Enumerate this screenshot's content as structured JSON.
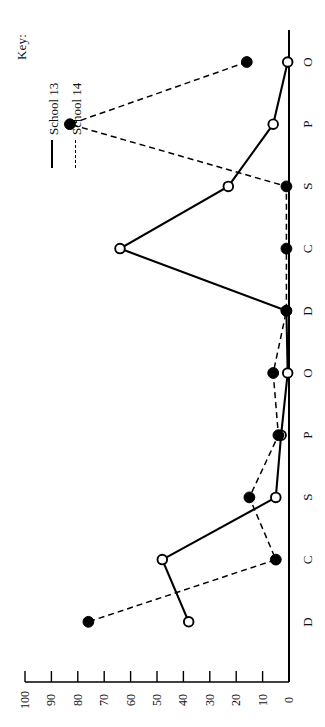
{
  "legend": {
    "title": "Key:",
    "entries": [
      {
        "label": "School 13",
        "style": "solid"
      },
      {
        "label": "School 14",
        "style": "dashed"
      }
    ]
  },
  "axes": {
    "value_axis": {
      "ticks": [
        "100",
        "90",
        "80",
        "70",
        "60",
        "50",
        "40",
        "30",
        "20",
        "10",
        "0"
      ],
      "min": 0,
      "max": 100
    },
    "category_axis": {
      "ticks": [
        "O",
        "P",
        "S",
        "C",
        "D",
        "O",
        "P",
        "S",
        "C",
        "D"
      ]
    }
  },
  "colors": {
    "line": "#000000",
    "marker_open_fill": "#ffffff",
    "marker_closed_fill": "#000000",
    "background": "#ffffff"
  },
  "chart_data": {
    "type": "line",
    "title": "",
    "xlabel": "",
    "ylabel": "",
    "orientation": "rotated-90-ccw",
    "categories": [
      "O",
      "P",
      "S",
      "C",
      "D",
      "O",
      "P",
      "S",
      "C",
      "D"
    ],
    "ylim": [
      0,
      100
    ],
    "grid": false,
    "legend_position": "top-left",
    "series": [
      {
        "name": "School 13",
        "style": "solid",
        "marker": "open-circle",
        "values": [
          0.5,
          6,
          23,
          64,
          1,
          0.5,
          3,
          5,
          48,
          38
        ]
      },
      {
        "name": "School 14",
        "style": "dashed",
        "marker": "filled-circle",
        "values": [
          16,
          83,
          1,
          1,
          1,
          6,
          4,
          15,
          5,
          76
        ]
      }
    ]
  }
}
